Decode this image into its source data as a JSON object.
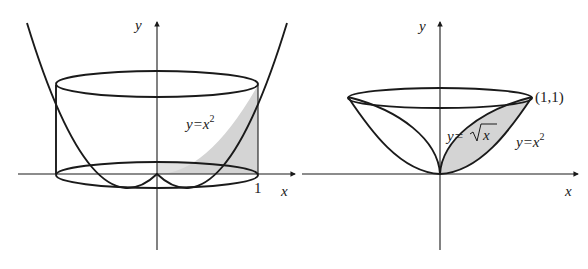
{
  "figures": [
    {
      "id": "left",
      "description": "Region under y=x^2 from x=0 to 1 rotated about the y-axis (shell/cylinder)",
      "axis_labels": {
        "x": "x",
        "y": "y"
      },
      "tick_labels": {
        "x_one": "1"
      },
      "curve_label": {
        "base": "y=x",
        "exp": "2"
      }
    },
    {
      "id": "right",
      "description": "Region between y=sqrt(x) and y=x^2 rotated about the y-axis",
      "axis_labels": {
        "x": "x",
        "y": "y"
      },
      "point_label": "(1,1)",
      "curve_labels": [
        {
          "base": "y=",
          "sqrt_arg": "x"
        },
        {
          "base": "y=x",
          "exp": "2"
        }
      ]
    }
  ],
  "colors": {
    "stroke": "#1a1a1a",
    "shade": "#d4d4d4",
    "background": "#ffffff"
  }
}
